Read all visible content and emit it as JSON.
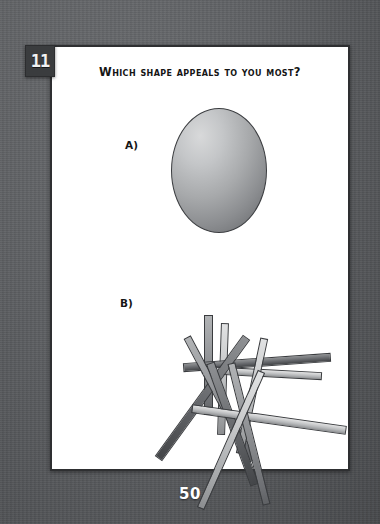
{
  "quiz": {
    "question_number": "11",
    "question_text": "Which shape appeals to you most?",
    "page_number": "50",
    "options": [
      {
        "label": "A)",
        "shape": "oval"
      },
      {
        "label": "B)",
        "shape": "scattered-sticks"
      }
    ]
  },
  "colors": {
    "backdrop": "#5d5f62",
    "page": "#ffffff",
    "page_border": "#2e2f31",
    "badge_bg": "#3a3c3e",
    "badge_text": "#f2f2f2",
    "ink": "#151515",
    "page_number_text": "#ffffff",
    "shape_light": "#d8d9da",
    "shape_dark": "#5f6164"
  },
  "shape_a": {
    "type": "ellipse",
    "fill_style": "radial-gradient",
    "highlight_position": "upper-left",
    "width": 94,
    "height": 123
  },
  "shape_b": {
    "type": "scattered-bars",
    "count": 11,
    "sticks": [
      {
        "name": "stick-1",
        "left": 152,
        "top": 52,
        "width": 9,
        "height": 100,
        "rotate": 0,
        "tone": "mid"
      },
      {
        "name": "stick-2",
        "left": 167,
        "top": 60,
        "width": 8,
        "height": 112,
        "rotate": 2,
        "tone": "light"
      },
      {
        "name": "stick-3",
        "left": 131,
        "top": 95,
        "width": 148,
        "height": 9,
        "rotate": -4,
        "tone": "dark"
      },
      {
        "name": "stick-4",
        "left": 150,
        "top": 106,
        "width": 120,
        "height": 8,
        "rotate": 3,
        "tone": "light"
      },
      {
        "name": "stick-5",
        "left": 146,
        "top": 60,
        "width": 9,
        "height": 150,
        "rotate": 36,
        "tone": "dark"
      },
      {
        "name": "stick-6",
        "left": 164,
        "top": 66,
        "width": 8,
        "height": 140,
        "rotate": -28,
        "tone": "mid"
      },
      {
        "name": "stick-7",
        "left": 196,
        "top": 74,
        "width": 8,
        "height": 118,
        "rotate": 12,
        "tone": "light"
      },
      {
        "name": "stick-8",
        "left": 176,
        "top": 96,
        "width": 9,
        "height": 130,
        "rotate": -20,
        "tone": "dark"
      },
      {
        "name": "stick-9",
        "left": 139,
        "top": 152,
        "width": 156,
        "height": 9,
        "rotate": 8,
        "tone": "light"
      },
      {
        "name": "stick-10",
        "left": 193,
        "top": 98,
        "width": 8,
        "height": 146,
        "rotate": -14,
        "tone": "mid"
      },
      {
        "name": "stick-11",
        "left": 175,
        "top": 102,
        "width": 8,
        "height": 150,
        "rotate": 24,
        "tone": "light"
      }
    ]
  }
}
